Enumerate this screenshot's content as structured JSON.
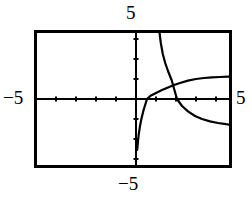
{
  "figure": {
    "kind": "graphing-calculator-plot",
    "background_color": "#ffffff",
    "ink_color": "#000000",
    "frame": {
      "left_px": 34,
      "top_px": 30,
      "right_px": 232,
      "bottom_px": 168,
      "border_width_px": 3
    },
    "labels": {
      "top": "5",
      "bottom": "−5",
      "left": "−5",
      "right": "5"
    },
    "axes": {
      "x_axis_y_px": 99,
      "y_axis_x_px": 136,
      "tick_spacing_px": 20,
      "tick_length_px": 5,
      "x_ticks": [
        -5,
        -4,
        -3,
        -2,
        -1,
        1,
        2,
        3,
        4,
        5
      ],
      "y_ticks": [
        -5,
        -4,
        -3,
        -2,
        -1,
        1,
        2,
        3,
        4,
        5
      ]
    }
  },
  "chart_data": {
    "type": "line",
    "title": "",
    "xlabel": "",
    "ylabel": "",
    "xlim": [
      -5,
      5
    ],
    "ylim": [
      -5,
      5
    ],
    "grid": false,
    "legend": "none",
    "annotations": [
      "vertical asymptote near x = 0 for rising curve",
      "vertical asymptote near x = 1.05 for falling curve",
      "curves intersect near (1.75, 0.55)"
    ],
    "series": [
      {
        "name": "rising-logarithmic-curve",
        "comment": "log-like curve, steep negative near x=0, crosses x-axis near x=0.55, flattens toward y~1.1",
        "x": [
          0.06,
          0.1,
          0.14,
          0.2,
          0.28,
          0.38,
          0.55,
          0.75,
          1.0,
          1.3,
          1.6,
          1.9,
          2.2,
          2.6,
          3.0,
          3.4,
          3.8,
          4.2,
          4.6,
          5.0
        ],
        "y": [
          -2.55,
          -2.1,
          -1.75,
          -1.35,
          -0.95,
          -0.55,
          0.0,
          0.18,
          0.3,
          0.45,
          0.58,
          0.7,
          0.8,
          0.92,
          1.0,
          1.05,
          1.08,
          1.1,
          1.12,
          1.12
        ]
      },
      {
        "name": "falling-steep-curve",
        "comment": "steeply decreasing branch entering top of frame near x=1.05, crossing x-axis near x=2.05, exiting right edge near y=-1.3",
        "x": [
          1.06,
          1.1,
          1.16,
          1.24,
          1.34,
          1.46,
          1.6,
          1.78,
          2.05,
          2.3,
          2.6,
          2.95,
          3.3,
          3.7,
          4.1,
          4.5,
          5.0
        ],
        "y": [
          5.0,
          4.2,
          3.45,
          2.8,
          2.25,
          1.8,
          1.4,
          0.95,
          0.0,
          -0.35,
          -0.62,
          -0.85,
          -1.0,
          -1.12,
          -1.2,
          -1.26,
          -1.32
        ]
      }
    ]
  }
}
